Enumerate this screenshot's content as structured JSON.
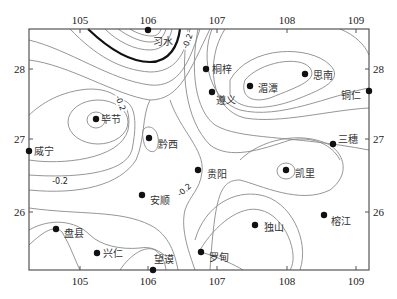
{
  "map": {
    "type": "contour-map",
    "x_axis": {
      "ticks": [
        {
          "label": "105",
          "x": 80
        },
        {
          "label": "106",
          "x": 148
        },
        {
          "label": "107",
          "x": 217
        },
        {
          "label": "108",
          "x": 287
        },
        {
          "label": "109",
          "x": 356
        }
      ]
    },
    "y_axis": {
      "ticks": [
        {
          "label": "28",
          "y": 69
        },
        {
          "label": "27",
          "y": 139
        },
        {
          "label": "26",
          "y": 212
        }
      ]
    },
    "contour_labels": [
      {
        "text": "-0.2",
        "x": 190,
        "y": 42,
        "rotate": -70
      },
      {
        "text": "-0.2",
        "x": 118,
        "y": 104,
        "rotate": 70
      },
      {
        "text": "-0.2",
        "x": 60,
        "y": 184,
        "rotate": 0
      },
      {
        "text": "-0.2",
        "x": 186,
        "y": 192,
        "rotate": -40
      }
    ],
    "stations": [
      {
        "name": "习水",
        "x": 148,
        "y": 30,
        "lx": 153,
        "ly": 45
      },
      {
        "name": "桐梓",
        "x": 206,
        "y": 69,
        "lx": 212,
        "ly": 73
      },
      {
        "name": "思南",
        "x": 305,
        "y": 74,
        "lx": 313,
        "ly": 79
      },
      {
        "name": "湄潭",
        "x": 250,
        "y": 86,
        "lx": 258,
        "ly": 92
      },
      {
        "name": "遵义",
        "x": 212,
        "y": 92,
        "lx": 216,
        "ly": 104
      },
      {
        "name": "铜仁",
        "x": 369,
        "y": 91,
        "lx": 341,
        "ly": 99
      },
      {
        "name": "毕节",
        "x": 96,
        "y": 119,
        "lx": 101,
        "ly": 123
      },
      {
        "name": "黔西",
        "x": 149,
        "y": 138,
        "lx": 158,
        "ly": 148
      },
      {
        "name": "三穗",
        "x": 333,
        "y": 144,
        "lx": 338,
        "ly": 143
      },
      {
        "name": "威宁",
        "x": 29,
        "y": 151,
        "lx": 34,
        "ly": 155
      },
      {
        "name": "贵阳",
        "x": 198,
        "y": 170,
        "lx": 207,
        "ly": 178
      },
      {
        "name": "凯里",
        "x": 286,
        "y": 170,
        "lx": 295,
        "ly": 177
      },
      {
        "name": "安顺",
        "x": 142,
        "y": 195,
        "lx": 150,
        "ly": 204
      },
      {
        "name": "榕江",
        "x": 324,
        "y": 215,
        "lx": 331,
        "ly": 225
      },
      {
        "name": "独山",
        "x": 255,
        "y": 225,
        "lx": 264,
        "ly": 231
      },
      {
        "name": "盘县",
        "x": 56,
        "y": 229,
        "lx": 64,
        "ly": 237
      },
      {
        "name": "兴仁",
        "x": 97,
        "y": 253,
        "lx": 103,
        "ly": 257
      },
      {
        "name": "罗甸",
        "x": 201,
        "y": 252,
        "lx": 209,
        "ly": 261
      },
      {
        "name": "望谟",
        "x": 153,
        "y": 270,
        "lx": 154,
        "ly": 263
      }
    ]
  }
}
